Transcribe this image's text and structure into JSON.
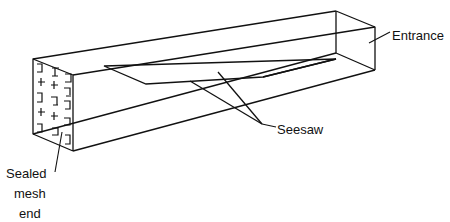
{
  "diagram": {
    "labels": {
      "entrance": "Entrance",
      "seesaw": "Seesaw",
      "sealed_line1": "Sealed",
      "sealed_line2": "mesh",
      "sealed_line3": "end"
    },
    "colors": {
      "stroke": "#111111",
      "background": "#ffffff"
    }
  }
}
